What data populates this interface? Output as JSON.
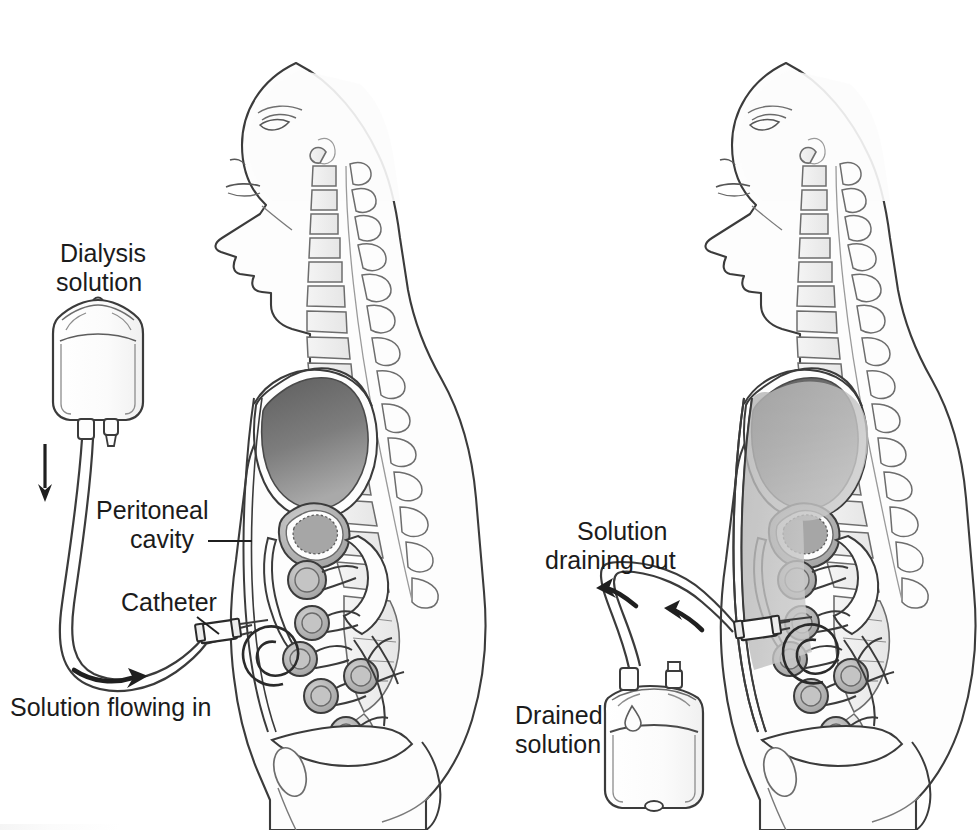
{
  "figure": {
    "type": "medical-illustration",
    "background_color": "#ffffff",
    "line_color": "#3a3a3a",
    "panels": [
      {
        "id": "left-panel",
        "phase": "fill",
        "labels": [
          {
            "id": "dialysis-solution",
            "text_lines": [
              "Dialysis",
              "solution"
            ],
            "x": 100,
            "y": 252
          },
          {
            "id": "peritoneal-cavity",
            "text_lines": [
              "Peritoneal",
              "cavity"
            ],
            "x": 176,
            "y": 512,
            "has_leader_line": true
          },
          {
            "id": "catheter",
            "text_lines": [
              "Catheter"
            ],
            "x": 205,
            "y": 606,
            "has_leader_line": true
          },
          {
            "id": "solution-flowing-in",
            "text_lines": [
              "Solution flowing in"
            ],
            "x": 8,
            "y": 712
          }
        ],
        "arrows": [
          {
            "id": "inflow-down-arrow",
            "direction": "down"
          },
          {
            "id": "inflow-curve-arrow",
            "direction": "right"
          }
        ],
        "bag": {
          "id": "dialysis-bag",
          "filled": true,
          "fill_tone": "#fdfdfd"
        },
        "cavity_shaded": false
      },
      {
        "id": "right-panel",
        "phase": "drain",
        "labels": [
          {
            "id": "solution-draining-out",
            "text_lines": [
              "Solution",
              "draining out"
            ],
            "x": 660,
            "y": 533
          },
          {
            "id": "drained-solution",
            "text_lines": [
              "Drained",
              "solution"
            ],
            "x": 527,
            "y": 716
          }
        ],
        "arrows": [
          {
            "id": "outflow-curve-arrow",
            "direction": "left"
          },
          {
            "id": "outflow-tube-arrow",
            "direction": "up-left"
          }
        ],
        "bag": {
          "id": "drained-bag",
          "filled": true,
          "fill_tone": "#f7f7f7",
          "drip": true
        },
        "cavity_shaded": true,
        "cavity_shade_color": "#b9b9b9"
      }
    ],
    "anatomy_parts": [
      "head",
      "face-profile",
      "neck",
      "cervical-vertebrae",
      "thoracic-vertebrae",
      "lumbar-vertebrae",
      "sacrum",
      "spinal-cord",
      "diaphragm",
      "liver",
      "stomach",
      "intestinal-loops",
      "peritoneal-cavity",
      "bladder",
      "catheter-coil"
    ],
    "colors": {
      "outline": "#3b3b3b",
      "body_fill": "#fdfdfd",
      "liver": "#6e6e6e",
      "organ_fill": "#bdbdbd",
      "bone_fill": "#efefef",
      "cavity_fluid": "#b9b9b9",
      "text": "#1b1b1b"
    }
  }
}
